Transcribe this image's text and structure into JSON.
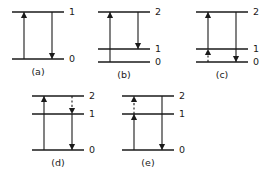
{
  "figure": {
    "background_color": "#ffffff",
    "line_color": "#1a1a1a",
    "panels": [
      {
        "id": "a",
        "caption": "(a)",
        "levels": [
          {
            "label": "0",
            "y": 55
          },
          {
            "label": "1",
            "y": 8
          }
        ],
        "transitions": [
          {
            "name": "absorption-0-to-1",
            "x": 18,
            "from_y": 55,
            "to_y": 8,
            "style": "solid",
            "direction": "up"
          },
          {
            "name": "emission-1-to-0",
            "x": 46,
            "from_y": 8,
            "to_y": 55,
            "style": "solid",
            "direction": "down"
          }
        ]
      },
      {
        "id": "b",
        "caption": "(b)",
        "levels": [
          {
            "label": "0",
            "y": 58
          },
          {
            "label": "1",
            "y": 45
          },
          {
            "label": "2",
            "y": 8
          }
        ],
        "transitions": [
          {
            "name": "absorption-0-to-2",
            "x": 18,
            "from_y": 58,
            "to_y": 8,
            "style": "solid",
            "direction": "up"
          },
          {
            "name": "emission-2-to-1",
            "x": 46,
            "from_y": 8,
            "to_y": 45,
            "style": "solid",
            "direction": "down"
          }
        ]
      },
      {
        "id": "c",
        "caption": "(c)",
        "levels": [
          {
            "label": "0",
            "y": 58
          },
          {
            "label": "1",
            "y": 45
          },
          {
            "label": "2",
            "y": 8
          }
        ],
        "transitions": [
          {
            "name": "relaxation-0-to-1-dashed",
            "x": 18,
            "from_y": 58,
            "to_y": 45,
            "style": "dashed",
            "direction": "up"
          },
          {
            "name": "absorption-1-to-2",
            "x": 18,
            "from_y": 45,
            "to_y": 8,
            "style": "solid",
            "direction": "up"
          },
          {
            "name": "emission-2-to-0",
            "x": 46,
            "from_y": 8,
            "to_y": 58,
            "style": "solid",
            "direction": "down"
          }
        ]
      },
      {
        "id": "d",
        "caption": "(d)",
        "levels": [
          {
            "label": "0",
            "y": 62
          },
          {
            "label": "1",
            "y": 26
          },
          {
            "label": "2",
            "y": 8
          }
        ],
        "transitions": [
          {
            "name": "absorption-0-to-2",
            "x": 18,
            "from_y": 62,
            "to_y": 8,
            "style": "solid",
            "direction": "up"
          },
          {
            "name": "relaxation-2-to-1-dashed",
            "x": 46,
            "from_y": 8,
            "to_y": 26,
            "style": "dashed",
            "direction": "down"
          },
          {
            "name": "emission-1-to-0",
            "x": 46,
            "from_y": 26,
            "to_y": 62,
            "style": "solid",
            "direction": "down"
          }
        ]
      },
      {
        "id": "e",
        "caption": "(e)",
        "levels": [
          {
            "label": "0",
            "y": 62
          },
          {
            "label": "1",
            "y": 26
          },
          {
            "label": "2",
            "y": 8
          }
        ],
        "transitions": [
          {
            "name": "absorption-0-to-1",
            "x": 18,
            "from_y": 62,
            "to_y": 26,
            "style": "solid",
            "direction": "up"
          },
          {
            "name": "relaxation-1-to-2-dashed",
            "x": 18,
            "from_y": 26,
            "to_y": 8,
            "style": "dashed",
            "direction": "up"
          },
          {
            "name": "emission-2-to-0",
            "x": 46,
            "from_y": 8,
            "to_y": 62,
            "style": "solid",
            "direction": "down"
          }
        ]
      }
    ]
  }
}
